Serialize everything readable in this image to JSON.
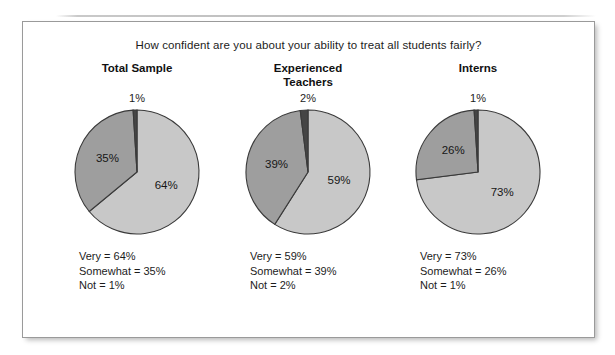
{
  "figure": {
    "question": "How confident are you about your ability to treat all students fairly?",
    "colors": {
      "very_slice": "#c8c8c8",
      "somewhat_slice": "#9e9e9e",
      "not_slice": "#454545",
      "slice_outline": "#3a3a3a",
      "panel_border": "#9a9a9a",
      "text": "#1c1c1c"
    }
  },
  "chart_data": {
    "type": "pie",
    "title": "How confident are you about your ability to treat all students fairly?",
    "categories": [
      "Very",
      "Somewhat",
      "Not"
    ],
    "charts": [
      {
        "title": "Total Sample",
        "sliver_label": "1%",
        "values": [
          64,
          35,
          1
        ],
        "slice_labels": [
          "64%",
          "35%",
          "1%"
        ],
        "legend": [
          "Very = 64%",
          "Somewhat = 35%",
          "Not = 1%"
        ]
      },
      {
        "title": "Experienced\nTeachers",
        "sliver_label": "2%",
        "values": [
          59,
          39,
          2
        ],
        "slice_labels": [
          "59%",
          "39%",
          "2%"
        ],
        "legend": [
          "Very = 59%",
          "Somewhat = 39%",
          "Not = 2%"
        ]
      },
      {
        "title": "Interns",
        "sliver_label": "1%",
        "values": [
          73,
          26,
          1
        ],
        "slice_labels": [
          "73%",
          "26%",
          "1%"
        ],
        "legend": [
          "Very = 73%",
          "Somewhat = 26%",
          "Not = 1%"
        ]
      }
    ]
  }
}
